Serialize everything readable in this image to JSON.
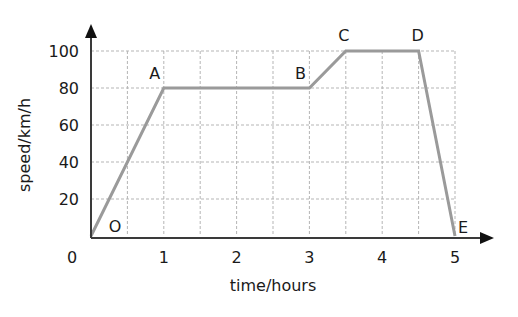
{
  "chart_data": {
    "type": "line",
    "title": "",
    "xlabel": "time/hours",
    "ylabel": "speed/km/h",
    "xlim": [
      0,
      5
    ],
    "ylim": [
      0,
      100
    ],
    "x_ticks": [
      0,
      1,
      2,
      3,
      4,
      5
    ],
    "x_tick_labels": [
      "0",
      "1",
      "2",
      "3",
      "4",
      "5"
    ],
    "y_ticks": [
      20,
      40,
      60,
      80,
      100
    ],
    "y_tick_labels": [
      "20",
      "40",
      "60",
      "80",
      "100"
    ],
    "grid": true,
    "grid_x_step": 0.5,
    "grid_y_step": 20,
    "legend": null,
    "series": [
      {
        "name": "journey",
        "color": "#9a9a9a",
        "points": [
          {
            "label": "O",
            "x": 0,
            "y": 0
          },
          {
            "label": "A",
            "x": 1,
            "y": 80
          },
          {
            "label": "B",
            "x": 3,
            "y": 80
          },
          {
            "label": "C",
            "x": 3.5,
            "y": 100
          },
          {
            "label": "D",
            "x": 4.5,
            "y": 100
          },
          {
            "label": "E",
            "x": 5,
            "y": 0
          }
        ]
      }
    ],
    "annotations": [
      "O",
      "A",
      "B",
      "C",
      "D",
      "E"
    ]
  },
  "colors": {
    "line": "#9a9a9a",
    "grid": "#b5b5b5",
    "axis": "#3a3a3a",
    "text": "#1a1a1a"
  }
}
